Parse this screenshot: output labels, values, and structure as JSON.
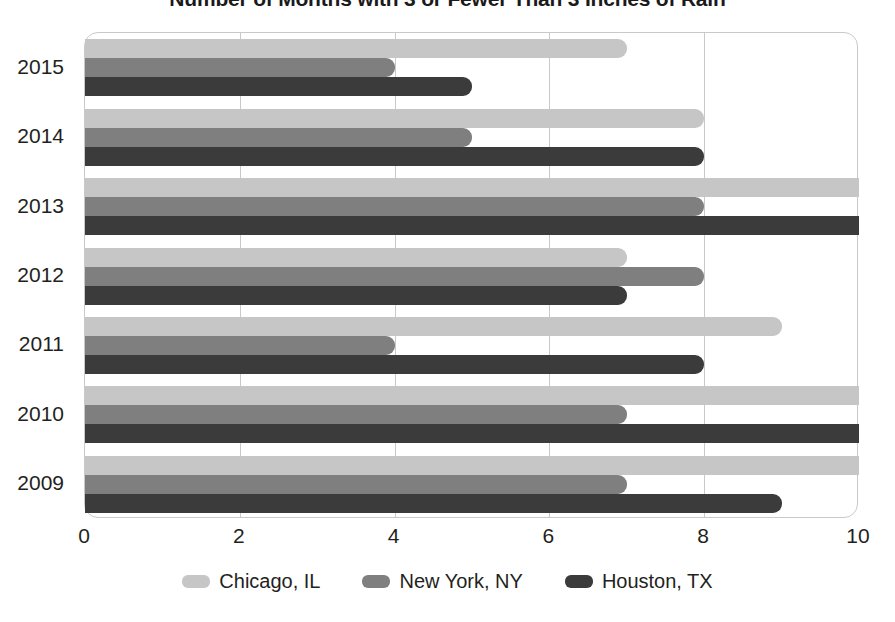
{
  "chart_data": {
    "type": "bar",
    "orientation": "horizontal",
    "title": "Number of Months with 3 or Fewer Than 3 Inches of Rain",
    "xlabel": "",
    "ylabel": "",
    "categories": [
      "2009",
      "2010",
      "2011",
      "2012",
      "2013",
      "2014",
      "2015"
    ],
    "display_order": [
      "2015",
      "2014",
      "2013",
      "2012",
      "2011",
      "2010",
      "2009"
    ],
    "series": [
      {
        "name": "Chicago, IL",
        "color": "#c6c6c6",
        "values": [
          10,
          10,
          9,
          7,
          10,
          8,
          7
        ]
      },
      {
        "name": "New York, NY",
        "color": "#7f7f7f",
        "values": [
          7,
          7,
          4,
          8,
          8,
          5,
          4
        ]
      },
      {
        "name": "Houston, TX",
        "color": "#3b3b3b",
        "values": [
          9,
          10,
          8,
          7,
          10,
          8,
          5
        ]
      }
    ],
    "xlim": [
      0,
      10
    ],
    "xticks": [
      "0",
      "2",
      "4",
      "6",
      "8",
      "10"
    ],
    "xtick_values": [
      0,
      2,
      4,
      6,
      8,
      10
    ],
    "grid": true,
    "gridlines_at": [
      2,
      4,
      6,
      8
    ],
    "legend_position": "bottom",
    "plot_border_color": "#c9c9c9",
    "background_color": "#ffffff"
  },
  "legend": {
    "items": [
      {
        "label": "Chicago, IL"
      },
      {
        "label": "New York, NY"
      },
      {
        "label": "Houston, TX"
      }
    ]
  }
}
